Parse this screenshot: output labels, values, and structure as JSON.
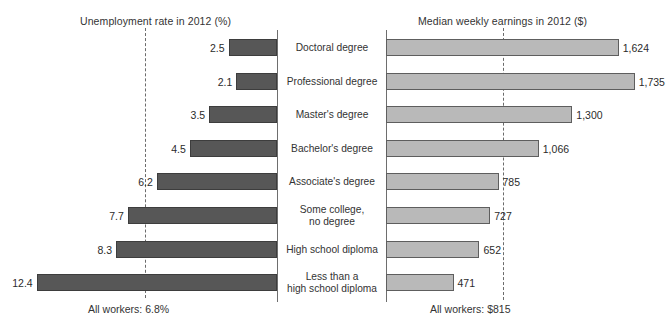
{
  "chart_data": {
    "type": "bar",
    "orientation": "horizontal-bidirectional",
    "categories": [
      "Doctoral degree",
      "Professional degree",
      "Master's degree",
      "Bachelor's degree",
      "Associate's degree",
      "Some college, no degree",
      "High school diploma",
      "Less than a high school diploma"
    ],
    "category_lines": [
      [
        "Doctoral degree"
      ],
      [
        "Professional degree"
      ],
      [
        "Master's degree"
      ],
      [
        "Bachelor's degree"
      ],
      [
        "Associate's degree"
      ],
      [
        "Some college,",
        "no degree"
      ],
      [
        "High school diploma"
      ],
      [
        "Less than a",
        "high school diploma"
      ]
    ],
    "series": [
      {
        "name": "Unemployment rate in 2012 (%)",
        "unit": "%",
        "direction": "left",
        "values": [
          2.5,
          2.1,
          3.5,
          4.5,
          6.2,
          7.7,
          8.3,
          12.4
        ],
        "labels": [
          "2.5",
          "2.1",
          "3.5",
          "4.5",
          "6.2",
          "7.7",
          "8.3",
          "12.4"
        ],
        "color": "#575757",
        "reference_line": {
          "value": 6.8,
          "label": "All workers: 6.8%"
        },
        "axis_max": 13.0
      },
      {
        "name": "Median weekly earnings in 2012 ($)",
        "unit": "$",
        "direction": "right",
        "values": [
          1624,
          1735,
          1300,
          1066,
          785,
          727,
          652,
          471
        ],
        "labels": [
          "1,624",
          "1,735",
          "1,300",
          "1,066",
          "785",
          "727",
          "652",
          "471"
        ],
        "color": "#b9b9b9",
        "reference_line": {
          "value": 815,
          "label": "All workers: $815"
        },
        "axis_max": 1800
      }
    ],
    "xlabel": "",
    "ylabel": "",
    "grid": false,
    "legend": "none"
  },
  "left_panel": {
    "title": "Unemployment rate in 2012 (%)",
    "footnote": "All workers: 6.8%"
  },
  "right_panel": {
    "title": "Median weekly earnings in 2012 ($)",
    "footnote": "All workers: $815"
  },
  "colors": {
    "left_bar": "#575757",
    "right_bar": "#b9b9b9",
    "axis": "#6e6e6e",
    "dash": "#6b6b6b",
    "text": "#2b2b2b",
    "background": "#ffffff"
  }
}
